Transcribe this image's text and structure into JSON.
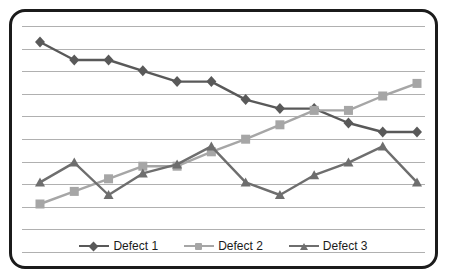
{
  "chart_data": {
    "type": "line",
    "title": "",
    "subtitle": "",
    "xlabel": "",
    "ylabel": "",
    "xlim": [
      1,
      12
    ],
    "ylim": [
      0,
      11
    ],
    "grid": true,
    "gridline_count": 11,
    "legend_position": "bottom",
    "x": [
      1,
      2,
      3,
      4,
      5,
      6,
      7,
      8,
      9,
      10,
      11,
      12
    ],
    "series": [
      {
        "name": "Defect 1",
        "color": "#595959",
        "marker": "diamond",
        "values": [
          10.0,
          9.0,
          9.0,
          8.4,
          7.8,
          7.8,
          6.8,
          6.3,
          6.3,
          5.5,
          5.0,
          5.0
        ]
      },
      {
        "name": "Defect 2",
        "color": "#a6a6a6",
        "marker": "square",
        "values": [
          1.0,
          1.7,
          2.4,
          3.1,
          3.1,
          3.9,
          4.6,
          5.4,
          6.2,
          6.2,
          7.0,
          7.7
        ]
      },
      {
        "name": "Defect 3",
        "color": "#6e6e6e",
        "marker": "triangle",
        "values": [
          2.2,
          3.3,
          1.5,
          2.7,
          3.2,
          4.2,
          2.2,
          1.5,
          2.6,
          3.3,
          4.2,
          2.2
        ]
      }
    ]
  },
  "legend": {
    "items": [
      {
        "label": "Defect 1",
        "color": "#595959",
        "marker": "diamond"
      },
      {
        "label": "Defect 2",
        "color": "#a6a6a6",
        "marker": "square"
      },
      {
        "label": "Defect 3",
        "color": "#6e6e6e",
        "marker": "triangle"
      }
    ]
  },
  "style": {
    "border_color": "#1b1b1b",
    "gridline_color": "#b0b0b0",
    "background": "#ffffff"
  }
}
